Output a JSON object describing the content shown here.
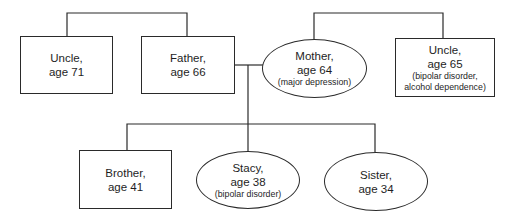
{
  "diagram": {
    "type": "family-genogram",
    "line_color": "#2a2a2a",
    "members": {
      "uncle_paternal": {
        "name": "Uncle,",
        "age": "age 71",
        "note": "",
        "shape": "square"
      },
      "father": {
        "name": "Father,",
        "age": "age 66",
        "note": "",
        "shape": "square"
      },
      "mother": {
        "name": "Mother,",
        "age": "age 64",
        "note": "(major depression)",
        "shape": "ellipse"
      },
      "uncle_maternal": {
        "name": "Uncle,",
        "age": "age 65",
        "note": "(bipolar disorder,",
        "note2": "alcohol dependence)",
        "shape": "square"
      },
      "brother": {
        "name": "Brother,",
        "age": "age 41",
        "note": "",
        "shape": "square"
      },
      "stacy": {
        "name": "Stacy,",
        "age": "age 38",
        "note": "(bipolar disorder)",
        "shape": "ellipse"
      },
      "sister": {
        "name": "Sister,",
        "age": "age 34",
        "note": "",
        "shape": "ellipse"
      }
    },
    "relationships": [
      {
        "type": "siblings",
        "members": [
          "uncle_paternal",
          "father"
        ]
      },
      {
        "type": "siblings",
        "members": [
          "mother",
          "uncle_maternal"
        ]
      },
      {
        "type": "marriage",
        "members": [
          "father",
          "mother"
        ]
      },
      {
        "type": "children",
        "parents": [
          "father",
          "mother"
        ],
        "members": [
          "brother",
          "stacy",
          "sister"
        ]
      }
    ]
  }
}
